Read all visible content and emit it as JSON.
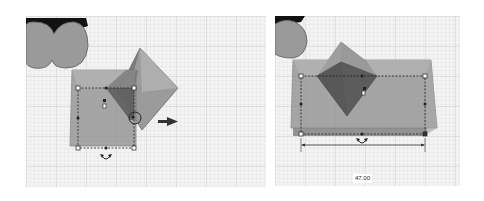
{
  "panels": [
    {
      "id": "before",
      "description": "workplane view with box and pyramid, drag handle selected",
      "icons": [
        "heart-shape",
        "box-shape",
        "pyramid-shape",
        "resize-handle",
        "move-arrow-icon",
        "rotate-arrow-icon"
      ]
    },
    {
      "id": "after",
      "description": "box stretched to the right, dimension shown",
      "icons": [
        "heart-shape",
        "box-shape",
        "pyramid-shape",
        "resize-handle",
        "rotate-arrow-icon",
        "dimension-line"
      ],
      "dimension_value": "47.00"
    }
  ],
  "colors": {
    "grid_bg": "#f3f3f3",
    "grid_line": "#d6d6d6",
    "grid_major": "#bdbdbd",
    "shape_fill": "#8a8a8a",
    "shape_dark": "#555555",
    "selection": "#222222"
  }
}
